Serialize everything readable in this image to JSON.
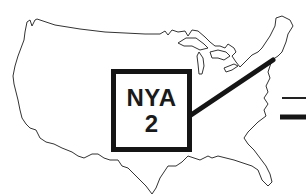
{
  "map": {
    "region": "United States (contiguous)",
    "outline_color": "#333333",
    "background": "#ffffff"
  },
  "label": {
    "code": "NYA",
    "number": "2",
    "border_color": "#151515"
  },
  "connector": {
    "color": "#151515"
  },
  "legend": {
    "lines": [
      {
        "style": "thin"
      },
      {
        "style": "thick"
      }
    ]
  }
}
